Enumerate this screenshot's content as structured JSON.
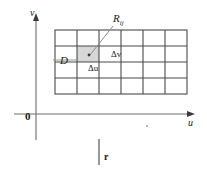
{
  "figure": {
    "axes": {
      "vertical_label": "v",
      "horizontal_label": "u",
      "origin_label": "0"
    },
    "labels": {
      "region": "D",
      "subrectangle": "R",
      "subrectangle_subscript": "ij",
      "delta_u": "Δu",
      "delta_v": "Δv",
      "bottom_marker": "r"
    },
    "grid": {
      "columns": 6,
      "rows": 4,
      "highlighted_cell": {
        "column": 2,
        "row": 2
      }
    },
    "colors": {
      "axis": "#6e6e6e",
      "grid": "#4a4a4a",
      "shade": "#d7d7d7",
      "leader": "#8c8c8c",
      "text": "#1a1a1a"
    }
  }
}
